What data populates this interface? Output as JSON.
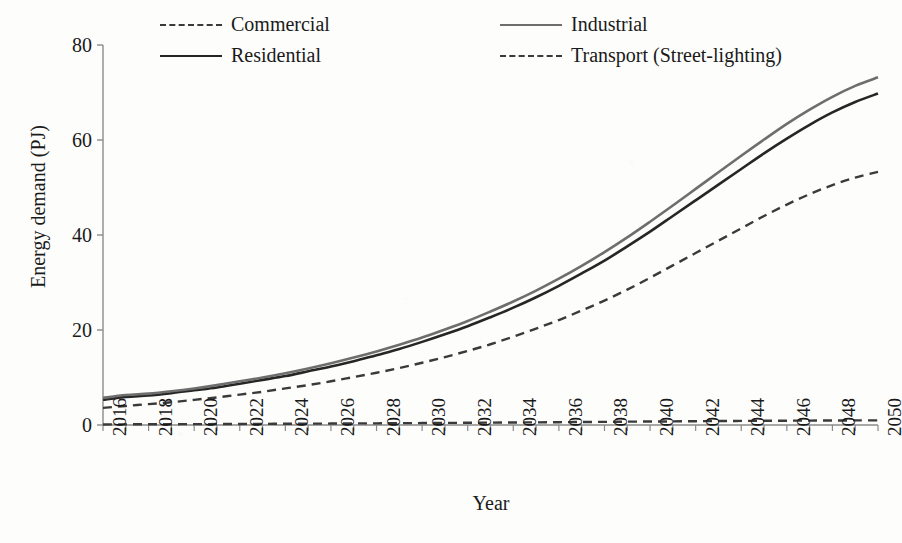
{
  "chart_data": {
    "type": "line",
    "title": "",
    "xlabel": "Year",
    "ylabel": "Energy demand (PJ)",
    "xlim": [
      2016,
      2050
    ],
    "ylim": [
      0,
      80
    ],
    "yticks": [
      0,
      20,
      40,
      60,
      80
    ],
    "xticks": [
      2016,
      2018,
      2020,
      2022,
      2024,
      2026,
      2028,
      2030,
      2032,
      2034,
      2036,
      2038,
      2040,
      2042,
      2044,
      2046,
      2048,
      2050
    ],
    "grid": false,
    "legend_position": "top",
    "x": [
      2016,
      2017,
      2018,
      2019,
      2020,
      2021,
      2022,
      2023,
      2024,
      2025,
      2026,
      2027,
      2028,
      2029,
      2030,
      2031,
      2032,
      2033,
      2034,
      2035,
      2036,
      2037,
      2038,
      2039,
      2040,
      2041,
      2042,
      2043,
      2044,
      2045,
      2046,
      2047,
      2048,
      2049,
      2050
    ],
    "series": [
      {
        "name": "Commercial",
        "style": "dashed",
        "color": "#3a3a3a",
        "values": [
          3.6,
          4.0,
          4.4,
          4.8,
          5.3,
          5.8,
          6.4,
          7.0,
          7.7,
          8.4,
          9.2,
          10.1,
          11.0,
          12.0,
          13.1,
          14.3,
          15.6,
          17.0,
          18.6,
          20.3,
          22.1,
          24.1,
          26.2,
          28.5,
          31.0,
          33.6,
          36.2,
          38.8,
          41.4,
          44.0,
          46.4,
          48.6,
          50.5,
          52.1,
          53.3
        ]
      },
      {
        "name": "Industrial",
        "style": "solid",
        "color": "#6e6e6e",
        "values": [
          5.7,
          6.3,
          6.6,
          7.1,
          7.7,
          8.4,
          9.2,
          10.0,
          10.9,
          11.9,
          13.0,
          14.2,
          15.5,
          16.9,
          18.4,
          20.1,
          21.9,
          23.9,
          26.0,
          28.3,
          30.8,
          33.5,
          36.4,
          39.5,
          42.8,
          46.2,
          49.7,
          53.2,
          56.7,
          60.1,
          63.4,
          66.4,
          69.1,
          71.4,
          73.2
        ]
      },
      {
        "name": "Residential",
        "style": "solid",
        "color": "#262626",
        "values": [
          5.3,
          5.9,
          6.2,
          6.7,
          7.3,
          7.9,
          8.7,
          9.5,
          10.3,
          11.3,
          12.3,
          13.4,
          14.7,
          16.0,
          17.5,
          19.1,
          20.8,
          22.7,
          24.7,
          26.9,
          29.3,
          31.9,
          34.6,
          37.6,
          40.7,
          44.0,
          47.3,
          50.6,
          53.9,
          57.2,
          60.3,
          63.2,
          65.8,
          68.0,
          69.8
        ]
      },
      {
        "name": "Transport (Street-lighting)",
        "style": "dashed",
        "color": "#3a3a3a",
        "values": [
          0.12,
          0.14,
          0.15,
          0.17,
          0.18,
          0.2,
          0.22,
          0.24,
          0.26,
          0.28,
          0.3,
          0.33,
          0.35,
          0.38,
          0.41,
          0.44,
          0.47,
          0.5,
          0.53,
          0.56,
          0.59,
          0.63,
          0.66,
          0.7,
          0.73,
          0.76,
          0.8,
          0.83,
          0.86,
          0.88,
          0.91,
          0.93,
          0.95,
          0.97,
          0.98
        ]
      }
    ]
  },
  "legend": {
    "items": [
      {
        "label": "Commercial",
        "style": "dashed-dark"
      },
      {
        "label": "Industrial",
        "style": "solid-gray"
      },
      {
        "label": "Residential",
        "style": "solid-dark"
      },
      {
        "label": "Transport (Street-lighting)",
        "style": "dashed-dark"
      }
    ]
  },
  "axes": {
    "y_title": "Energy demand (PJ)",
    "x_title": "Year",
    "y_tick_labels": [
      "80",
      "60",
      "40",
      "20",
      "0"
    ],
    "x_tick_labels": [
      "2016",
      "2018",
      "2020",
      "2022",
      "2024",
      "2026",
      "2028",
      "2030",
      "2032",
      "2034",
      "2036",
      "2038",
      "2040",
      "2042",
      "2044",
      "2046",
      "2048",
      "2050"
    ]
  },
  "colors": {
    "industrial": "#6e6e6e",
    "residential": "#262626",
    "commercial": "#3a3a3a",
    "transport": "#3a3a3a",
    "axis": "#8a8a8a",
    "background": "#fdfdfc"
  }
}
